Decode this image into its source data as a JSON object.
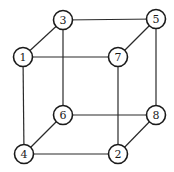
{
  "diagram": {
    "type": "cube-graph",
    "nodes": [
      {
        "id": "1",
        "label": "1",
        "x": 23,
        "y": 57
      },
      {
        "id": "2",
        "label": "2",
        "x": 118,
        "y": 154
      },
      {
        "id": "3",
        "label": "3",
        "x": 63,
        "y": 20
      },
      {
        "id": "4",
        "label": "4",
        "x": 24,
        "y": 154
      },
      {
        "id": "5",
        "label": "5",
        "x": 156,
        "y": 19
      },
      {
        "id": "6",
        "label": "6",
        "x": 63,
        "y": 115
      },
      {
        "id": "7",
        "label": "7",
        "x": 118,
        "y": 57
      },
      {
        "id": "8",
        "label": "8",
        "x": 156,
        "y": 115
      }
    ],
    "edges": [
      [
        "1",
        "3"
      ],
      [
        "3",
        "5"
      ],
      [
        "5",
        "7"
      ],
      [
        "1",
        "7"
      ],
      [
        "1",
        "4"
      ],
      [
        "3",
        "6"
      ],
      [
        "5",
        "8"
      ],
      [
        "7",
        "2"
      ],
      [
        "4",
        "6"
      ],
      [
        "6",
        "8"
      ],
      [
        "8",
        "2"
      ],
      [
        "4",
        "2"
      ]
    ],
    "node_radius": 9.5
  }
}
